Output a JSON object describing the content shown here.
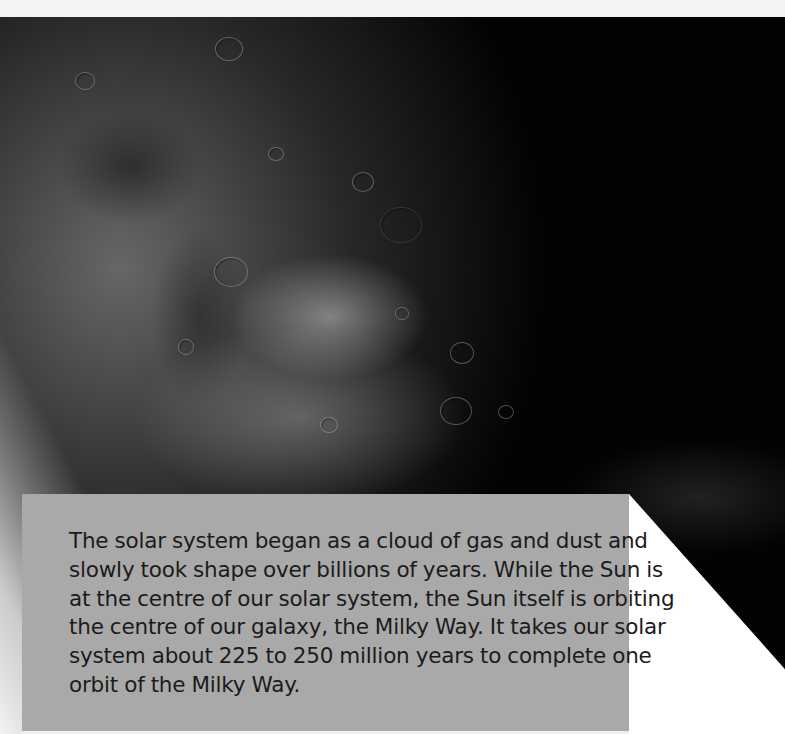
{
  "background": {
    "image": "moon-surface-with-earth-limb",
    "description": "Grayscale photograph of the Moon's cratered surface with a bright curved limb at the left edge",
    "colors": {
      "space": "#030303",
      "top_strip": "#f3f3f3",
      "box": "#a9a9a9",
      "text": "#1b1b1b",
      "wedge": "#ffffff"
    }
  },
  "info_box": {
    "lines": [
      "The solar system began as a cloud of gas and dust and",
      "slowly took shape over billions of years. While the Sun is",
      "at the centre of our solar system, the Sun itself is orbiting",
      "the centre of our galaxy, the Milky Way. It takes our solar",
      "system about 225 to 250 million years to complete one",
      "orbit of the Milky Way."
    ]
  }
}
